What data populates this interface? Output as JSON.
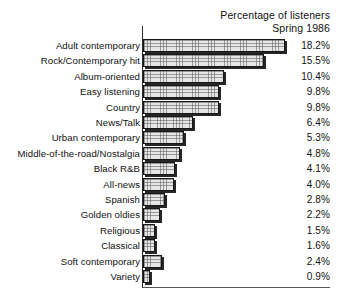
{
  "header": {
    "title_line1": "Percentage of listeners",
    "title_line2": "Spring 1986"
  },
  "chart_data": {
    "type": "bar",
    "orientation": "horizontal",
    "title": "Percentage of listeners Spring 1986",
    "xlabel": "",
    "ylabel": "",
    "xlim": [
      0,
      18.2
    ],
    "grid": false,
    "legend": "none",
    "value_suffix": "%",
    "categories": [
      "Adult contemporary",
      "Rock/Contemporary hit",
      "Album-oriented",
      "Easy listening",
      "Country",
      "News/Talk",
      "Urban contemporary",
      "Middle-of-the-road/Nostalgia",
      "Black R&B",
      "All-news",
      "Spanish",
      "Golden oldies",
      "Religious",
      "Classical",
      "Soft contemporary",
      "Variety"
    ],
    "values": [
      18.2,
      15.5,
      10.4,
      9.8,
      9.8,
      6.4,
      5.3,
      4.8,
      4.1,
      4.0,
      2.8,
      2.2,
      1.5,
      1.6,
      2.4,
      0.9
    ],
    "value_labels": [
      "18.2%",
      "15.5%",
      "10.4%",
      "9.8%",
      "9.8%",
      "6.4%",
      "5.3%",
      "4.8%",
      "4.1%",
      "4.0%",
      "2.8%",
      "2.2%",
      "1.5%",
      "1.6%",
      "2.4%",
      "0.9%"
    ]
  },
  "layout": {
    "row_top_start": 38,
    "row_step": 15.4,
    "px_per_unit": 7.8
  }
}
